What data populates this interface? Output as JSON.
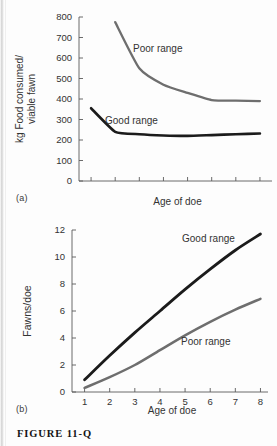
{
  "figure": {
    "caption": "FIGURE  11-Q",
    "panel_a_label": "(a)",
    "panel_b_label": "(b)"
  },
  "colors": {
    "good_range": "#1b1b1b",
    "poor_range": "#6e6e6e",
    "axis": "#5a5a5a",
    "text": "#333333",
    "background": "#fdfdfd"
  },
  "chart_data": [
    {
      "id": "panel-a",
      "type": "line",
      "title": "",
      "xlabel": "Age of doe",
      "ylabel": "kg Food consumed/\nviable fawn",
      "ylabel_line1": "kg Food consumed/",
      "ylabel_line2": "viable fawn",
      "xlim": [
        0.5,
        8.5
      ],
      "ylim": [
        0,
        800
      ],
      "yticks": [
        0,
        100,
        200,
        300,
        400,
        500,
        600,
        700,
        800
      ],
      "yticklabels": [
        "0",
        "100",
        "200",
        "300",
        "400",
        "500",
        "600",
        "700",
        "800"
      ],
      "xticks": [
        1,
        2,
        3,
        4,
        5,
        6,
        7,
        8
      ],
      "xticklabels": [
        "",
        "",
        "",
        "",
        "",
        "",
        "",
        ""
      ],
      "grid": false,
      "legend_position": "inline-annotations",
      "series": [
        {
          "name": "Poor range",
          "color": "#6e6e6e",
          "x": [
            2,
            3,
            4,
            5,
            6,
            7,
            8
          ],
          "values": [
            775,
            550,
            470,
            430,
            395,
            392,
            390
          ],
          "annotation": "Poor range"
        },
        {
          "name": "Good range",
          "color": "#1b1b1b",
          "x": [
            1,
            2,
            3,
            4,
            5,
            6,
            7,
            8
          ],
          "values": [
            355,
            240,
            228,
            222,
            220,
            224,
            228,
            232
          ],
          "annotation": "Good range"
        }
      ]
    },
    {
      "id": "panel-b",
      "type": "line",
      "title": "",
      "xlabel": "Age of doe",
      "ylabel": "Fawns/doe",
      "xlim": [
        0.5,
        8.3
      ],
      "ylim": [
        0,
        12
      ],
      "yticks": [
        0,
        2,
        4,
        6,
        8,
        10,
        12
      ],
      "yticklabels": [
        "0",
        "2",
        "4",
        "6",
        "8",
        "10",
        "12"
      ],
      "xticks": [
        1,
        2,
        3,
        4,
        5,
        6,
        7,
        8
      ],
      "xticklabels": [
        "1",
        "2",
        "3",
        "4",
        "5",
        "6",
        "7",
        "8"
      ],
      "grid": false,
      "legend_position": "inline-annotations",
      "series": [
        {
          "name": "Good range",
          "color": "#1b1b1b",
          "x": [
            1,
            2,
            3,
            4,
            5,
            6,
            7,
            8
          ],
          "values": [
            0.9,
            2.7,
            4.4,
            6.0,
            7.6,
            9.1,
            10.5,
            11.7
          ],
          "annotation": "Good range"
        },
        {
          "name": "Poor range",
          "color": "#6e6e6e",
          "x": [
            1,
            2,
            3,
            4,
            5,
            6,
            7,
            8
          ],
          "values": [
            0.3,
            1.1,
            2.0,
            3.1,
            4.2,
            5.2,
            6.1,
            6.9
          ],
          "annotation": "Poor range"
        }
      ]
    }
  ]
}
